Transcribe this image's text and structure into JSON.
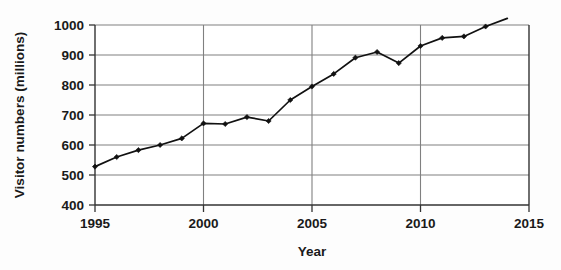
{
  "chart_data": {
    "type": "line",
    "title": "",
    "xlabel": "Year",
    "ylabel": "Visitor numbers (millions)",
    "xlim": [
      1995,
      2015
    ],
    "ylim": [
      400,
      1000
    ],
    "xticks": [
      1995,
      2000,
      2005,
      2010,
      2015
    ],
    "yticks": [
      400,
      500,
      600,
      700,
      800,
      900,
      1000
    ],
    "grid": "horizontal-and-vertical-at-major-ticks",
    "legend": "none",
    "x": [
      1995,
      1996,
      1997,
      1998,
      1999,
      2000,
      2001,
      2002,
      2003,
      2004,
      2005,
      2006,
      2007,
      2008,
      2009,
      2010,
      2011,
      2012,
      2013
    ],
    "values": [
      528,
      560,
      583,
      600,
      622,
      672,
      670,
      693,
      680,
      750,
      795,
      837,
      891,
      910,
      873,
      930,
      957,
      962,
      995
    ],
    "series": [
      {
        "name": "Visitor numbers",
        "x": [
          1995,
          1996,
          1997,
          1998,
          1999,
          2000,
          2001,
          2002,
          2003,
          2004,
          2005,
          2006,
          2007,
          2008,
          2009,
          2010,
          2011,
          2012,
          2013
        ],
        "values": [
          528,
          560,
          583,
          600,
          622,
          672,
          670,
          693,
          680,
          750,
          795,
          837,
          891,
          910,
          873,
          930,
          957,
          962,
          995
        ],
        "marker": "diamond",
        "color": "#111111"
      }
    ],
    "line_extends_to": {
      "x": 2014,
      "y": 1022
    },
    "colors": {
      "line": "#111111",
      "marker": "#111111",
      "grid": "#808080",
      "axis": "#333333",
      "text": "#1a1a1a",
      "background": "#fdfdfd"
    }
  },
  "axes": {
    "y_title": "Visitor numbers (millions)",
    "x_title": "Year",
    "y_tick_labels": [
      "1000",
      "900",
      "800",
      "700",
      "600",
      "500",
      "400"
    ],
    "x_tick_labels": [
      "1995",
      "2000",
      "2005",
      "2010",
      "2015"
    ]
  }
}
